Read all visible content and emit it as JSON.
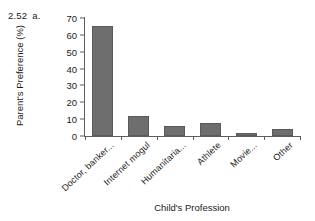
{
  "exercise": {
    "number": "2.52",
    "part": "a."
  },
  "chart_data": {
    "type": "bar",
    "title": "",
    "xlabel": "Child's Profession",
    "ylabel": "Parent's Preference (%)",
    "categories": [
      "Doctor, banker...",
      "Internet mogul",
      "Humanitaria...",
      "Athlete",
      "Movie...",
      "Other"
    ],
    "values": [
      65,
      12,
      6,
      8,
      2,
      4
    ],
    "ylim": [
      0,
      70
    ],
    "yticks": [
      70,
      60,
      50,
      40,
      30,
      20,
      10,
      0
    ],
    "grid": false,
    "legend": false,
    "bar_color": "#6e6e6e",
    "axis_color": "#5d5d5d"
  }
}
